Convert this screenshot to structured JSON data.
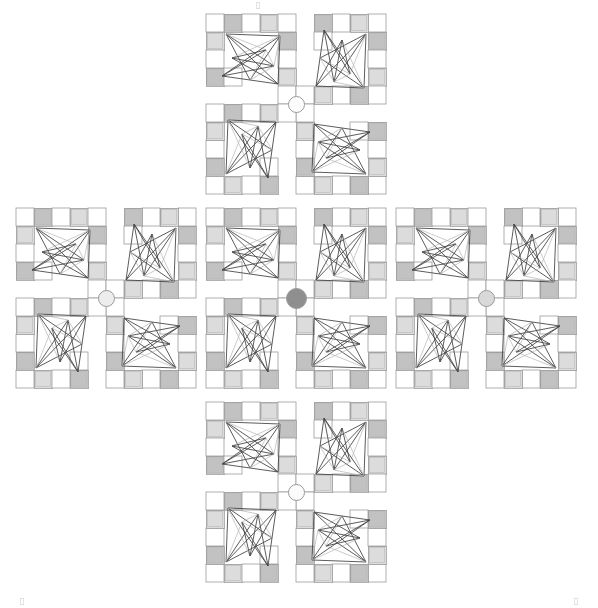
{
  "figure": {
    "title": "",
    "width": 598,
    "height": 608,
    "background": "#ffffff"
  },
  "palette": {
    "white": "#ffffff",
    "tile_light": "#f1f1f1",
    "tile_mid": "#dcdcdc",
    "tile_dark": "#c2c2c2",
    "tile_border": "#9c9c9c",
    "line_dark": "#4a4a4a",
    "line_light": "#b4b4b4",
    "hub_border": "#9a9a9a"
  },
  "clusters": [
    {
      "id": "cluster-top",
      "label": "Top cluster",
      "x": 201,
      "y": 9,
      "hub_fill": "#fdfdfd",
      "hub_size": 17
    },
    {
      "id": "cluster-left",
      "label": "Left cluster",
      "x": 11,
      "y": 203,
      "hub_fill": "#ededed",
      "hub_size": 17
    },
    {
      "id": "cluster-center",
      "label": "Center cluster",
      "x": 201,
      "y": 203,
      "hub_fill": "#8f8f8f",
      "hub_size": 21
    },
    {
      "id": "cluster-right",
      "label": "Right cluster",
      "x": 391,
      "y": 203,
      "hub_fill": "#d9d9d9",
      "hub_size": 17
    },
    {
      "id": "cluster-bottom",
      "label": "Bottom cluster",
      "x": 201,
      "y": 397,
      "hub_fill": "#fbfbfb",
      "hub_size": 17
    }
  ],
  "module": {
    "cell": 18,
    "shape_note": "L-shaped tile frame: 5-cell top row, 4-cell left column, plus a 2-cell right column tail and 1-cell bottom tail",
    "tiles": [
      {
        "col": 0,
        "row": 0,
        "shade": "white"
      },
      {
        "col": 1,
        "row": 0,
        "shade": "tile_dark"
      },
      {
        "col": 2,
        "row": 0,
        "shade": "white"
      },
      {
        "col": 3,
        "row": 0,
        "shade": "tile_mid"
      },
      {
        "col": 4,
        "row": 0,
        "shade": "white"
      },
      {
        "col": 0,
        "row": 1,
        "shade": "tile_mid"
      },
      {
        "col": 4,
        "row": 1,
        "shade": "tile_dark"
      },
      {
        "col": 0,
        "row": 2,
        "shade": "white"
      },
      {
        "col": 4,
        "row": 2,
        "shade": "white"
      },
      {
        "col": 0,
        "row": 3,
        "shade": "tile_dark"
      },
      {
        "col": 1,
        "row": 3,
        "shade": "white"
      },
      {
        "col": 4,
        "row": 3,
        "shade": "tile_mid"
      },
      {
        "col": 4,
        "row": 4,
        "shade": "white"
      }
    ],
    "nodes": [
      {
        "x": 20,
        "y": 20
      },
      {
        "x": 74,
        "y": 22
      },
      {
        "x": 68,
        "y": 52
      },
      {
        "x": 16,
        "y": 62
      },
      {
        "x": 44,
        "y": 66
      },
      {
        "x": 72,
        "y": 70
      },
      {
        "x": 26,
        "y": 44
      },
      {
        "x": 60,
        "y": 36
      }
    ],
    "edges": [
      [
        0,
        1,
        "dark"
      ],
      [
        0,
        2,
        "dark"
      ],
      [
        0,
        4,
        "dark"
      ],
      [
        0,
        5,
        "dark"
      ],
      [
        0,
        7,
        "light"
      ],
      [
        1,
        3,
        "dark"
      ],
      [
        1,
        4,
        "dark"
      ],
      [
        1,
        5,
        "dark"
      ],
      [
        1,
        6,
        "light"
      ],
      [
        2,
        3,
        "dark"
      ],
      [
        2,
        4,
        "light"
      ],
      [
        2,
        6,
        "dark"
      ],
      [
        3,
        5,
        "dark"
      ],
      [
        3,
        7,
        "dark"
      ],
      [
        4,
        7,
        "light"
      ],
      [
        5,
        6,
        "dark"
      ],
      [
        6,
        7,
        "dark"
      ],
      [
        2,
        7,
        "light"
      ],
      [
        1,
        2,
        "light"
      ]
    ]
  },
  "corner_marks": [
    {
      "id": "mark-top",
      "x": 256,
      "y": 2
    },
    {
      "id": "mark-bottom-left",
      "x": 20,
      "y": 598
    },
    {
      "id": "mark-bottom-right",
      "x": 574,
      "y": 598
    }
  ],
  "chart_data": {
    "type": "diagram",
    "title": "",
    "clusters": 5,
    "modules_per_cluster": 4,
    "module_rotations_deg": [
      0,
      90,
      180,
      270
    ],
    "hub_fills": [
      "#fdfdfd",
      "#ededed",
      "#8f8f8f",
      "#d9d9d9",
      "#fbfbfb"
    ],
    "layout": "plus / quincunx",
    "legend": [],
    "grid": false
  }
}
